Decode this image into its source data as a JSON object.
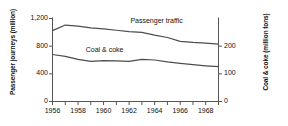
{
  "chart_data": {
    "type": "line",
    "title": "",
    "xlabel": "",
    "grid": false,
    "legend_position": "inline-labels",
    "x": [
      1956,
      1957,
      1958,
      1959,
      1960,
      1961,
      1962,
      1963,
      1964,
      1965,
      1966,
      1967,
      1968,
      1969
    ],
    "xlim": [
      1956,
      1969
    ],
    "x_tick_labels": [
      "1956",
      "1958",
      "1960",
      "1962",
      "1964",
      "1966",
      "1968"
    ],
    "x_tick_values": [
      1956,
      1958,
      1960,
      1962,
      1964,
      1966,
      1968
    ],
    "axes": [
      {
        "id": "left",
        "ylabel": "Passenger journeys (million)",
        "ylim": [
          0,
          1200
        ],
        "ticks": [
          0,
          400,
          800,
          1200
        ],
        "tick_labels": [
          "0",
          "400",
          "800",
          "1,200"
        ]
      },
      {
        "id": "right",
        "ylabel": "Coal & coke (million tons)",
        "ylim": [
          0,
          300
        ],
        "ticks": [
          0,
          100,
          200
        ],
        "tick_labels": [
          "0",
          "100",
          "200"
        ]
      }
    ],
    "series": [
      {
        "name": "Passenger traffic",
        "axis": "left",
        "units": "million journeys",
        "label_text": "Passenger traffic",
        "values": [
          1025,
          1105,
          1090,
          1065,
          1050,
          1030,
          1010,
          1000,
          960,
          925,
          870,
          855,
          845,
          830
        ]
      },
      {
        "name": "Coal & coke",
        "axis": "right",
        "units": "million tons",
        "label_text": "Coal & coke",
        "values": [
          170,
          163,
          152,
          145,
          148,
          147,
          145,
          152,
          150,
          143,
          138,
          133,
          129,
          126
        ]
      }
    ]
  }
}
